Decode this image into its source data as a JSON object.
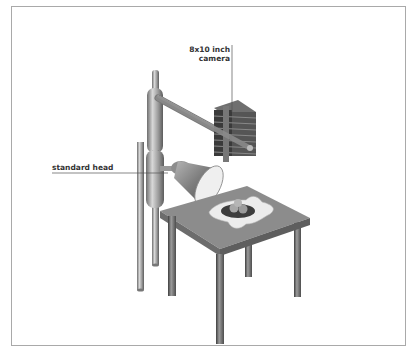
{
  "diagram": {
    "type": "technical-illustration",
    "labels": {
      "camera_line1": "8x10 inch",
      "camera_line2": "camera",
      "standard_head": "standard head"
    },
    "components": [
      "studio-stand-column",
      "boom-arm",
      "8x10-view-camera",
      "standard-head",
      "lamp-reflector",
      "table",
      "backdrop-cloth",
      "bowl-of-fruit"
    ],
    "colors": {
      "frame_border": "#a9a9a9",
      "metal_light": "#c8c8c8",
      "metal_mid": "#8f8f8f",
      "metal_dark": "#4a4a4a",
      "table_top": "#8a8a8a",
      "cloth": "#eaeaea",
      "label_text": "#333333",
      "leader_line": "#555555"
    }
  }
}
